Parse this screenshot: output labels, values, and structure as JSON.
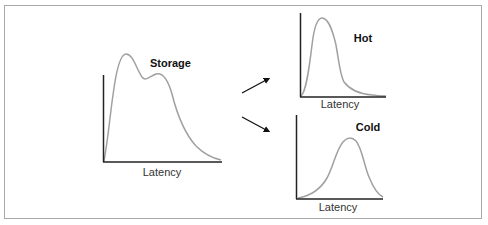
{
  "diagram": {
    "source_chart": {
      "title": "Storage",
      "xlabel": "Latency",
      "shape": "bimodal distribution"
    },
    "arrows": [
      {
        "from": "Storage",
        "to": "Hot"
      },
      {
        "from": "Storage",
        "to": "Cold"
      }
    ],
    "hot_chart": {
      "title": "Hot",
      "xlabel": "Latency",
      "shape": "low-latency peak, right-skewed"
    },
    "cold_chart": {
      "title": "Cold",
      "xlabel": "Latency",
      "shape": "higher-latency peak"
    },
    "colors": {
      "axis": "#222222",
      "curve": "#a0a0a0",
      "arrow": "#111111",
      "frame": "#a8a8a8"
    }
  }
}
